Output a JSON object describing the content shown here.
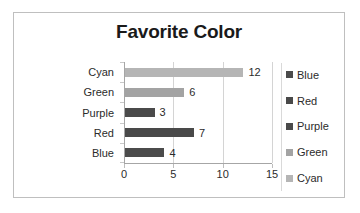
{
  "chart_data": {
    "type": "bar",
    "orientation": "horizontal",
    "title": "Favorite Color",
    "xlabel": "",
    "ylabel": "",
    "categories": [
      "Cyan",
      "Green",
      "Purple",
      "Red",
      "Blue"
    ],
    "values": [
      12,
      6,
      3,
      7,
      4
    ],
    "value_labels": [
      "12",
      "6",
      "3",
      "7",
      "4"
    ],
    "bar_colors": [
      "#b5b5b5",
      "#a3a3a3",
      "#4a4a4a",
      "#494949",
      "#4b4b4b"
    ],
    "xlim": [
      0,
      15
    ],
    "xticks": [
      0,
      5,
      10,
      15
    ],
    "xtick_labels": [
      "0",
      "5",
      "10",
      "15"
    ],
    "grid": "vertical",
    "legend": {
      "position": "right",
      "entries": [
        {
          "label": "Blue",
          "color": "#4b4b4b"
        },
        {
          "label": "Red",
          "color": "#494949"
        },
        {
          "label": "Purple",
          "color": "#4a4a4a"
        },
        {
          "label": "Green",
          "color": "#a3a3a3"
        },
        {
          "label": "Cyan",
          "color": "#b5b5b5"
        }
      ]
    },
    "colors": {
      "background": "#ffffff",
      "border": "#bfbfbf",
      "axis_line": "#a6a6a6",
      "gridline": "#d4d4d4",
      "text": "#2b2b2b",
      "title_text": "#1a1a1a"
    }
  }
}
